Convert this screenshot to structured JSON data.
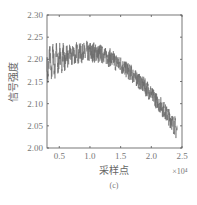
{
  "chart_data": {
    "type": "line",
    "title": "",
    "caption": "(c)",
    "xlabel": "采样点",
    "ylabel": "信号强度",
    "x_multiplier": "×10⁴",
    "xlim": [
      0.3,
      2.5
    ],
    "ylim": [
      2.0,
      2.3
    ],
    "x_ticks": [
      0.5,
      1.0,
      1.5,
      2.0,
      2.5
    ],
    "x_tick_labels": [
      "0.5",
      "1.0",
      "1.5",
      "2.0",
      "2.5"
    ],
    "y_ticks": [
      2.0,
      2.05,
      2.1,
      2.15,
      2.2,
      2.25,
      2.3
    ],
    "y_tick_labels": [
      "2.00",
      "2.05",
      "2.10",
      "2.15",
      "2.20",
      "2.25",
      "2.30"
    ],
    "grid": false,
    "legend": null,
    "line_color": "#6b6b6b",
    "series": [
      {
        "name": "信号强度",
        "description": "dense noisy signal band; envelope centre and half-width estimated",
        "x": [
          0.3,
          0.4,
          0.5,
          0.6,
          0.7,
          0.8,
          0.9,
          1.0,
          1.1,
          1.2,
          1.3,
          1.4,
          1.5,
          1.6,
          1.7,
          1.8,
          1.9,
          2.0,
          2.1,
          2.2,
          2.3,
          2.42
        ],
        "center": [
          2.185,
          2.195,
          2.2,
          2.205,
          2.21,
          2.213,
          2.215,
          2.216,
          2.215,
          2.212,
          2.205,
          2.197,
          2.188,
          2.177,
          2.165,
          2.152,
          2.138,
          2.122,
          2.105,
          2.087,
          2.068,
          2.04
        ],
        "upper": [
          2.225,
          2.235,
          2.237,
          2.237,
          2.238,
          2.24,
          2.242,
          2.243,
          2.24,
          2.235,
          2.228,
          2.218,
          2.208,
          2.197,
          2.185,
          2.172,
          2.158,
          2.142,
          2.125,
          2.107,
          2.09,
          2.065
        ],
        "lower": [
          2.135,
          2.15,
          2.165,
          2.175,
          2.185,
          2.19,
          2.192,
          2.193,
          2.192,
          2.19,
          2.183,
          2.176,
          2.168,
          2.157,
          2.145,
          2.132,
          2.118,
          2.102,
          2.085,
          2.067,
          2.045,
          2.015
        ]
      }
    ]
  }
}
